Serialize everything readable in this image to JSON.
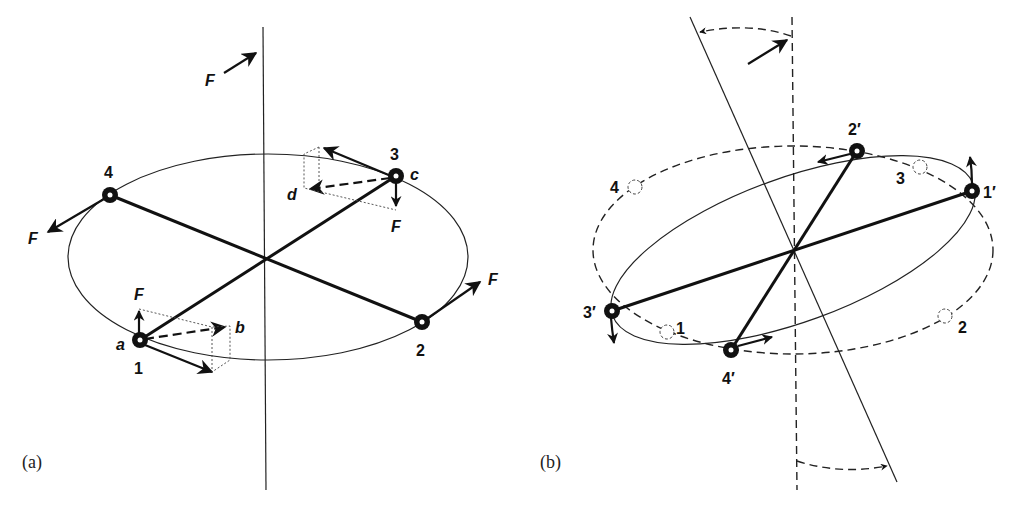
{
  "figure": {
    "panel_a": {
      "label": "(a)",
      "axis_force_label": "F",
      "masses": [
        {
          "id": "1",
          "label": "1",
          "point_label": "a",
          "force_label": "F",
          "resultant_label": "b"
        },
        {
          "id": "2",
          "label": "2",
          "force_label": "F"
        },
        {
          "id": "3",
          "label": "3",
          "point_label": "c",
          "force_label": "F",
          "resultant_label": "d"
        },
        {
          "id": "4",
          "label": "4",
          "force_label": "F"
        }
      ]
    },
    "panel_b": {
      "label": "(b)",
      "new_positions": [
        {
          "id": "1p",
          "label": "1′"
        },
        {
          "id": "2p",
          "label": "2′"
        },
        {
          "id": "3p",
          "label": "3′"
        },
        {
          "id": "4p",
          "label": "4′"
        }
      ],
      "old_positions": [
        {
          "id": "1",
          "label": "1"
        },
        {
          "id": "2",
          "label": "2"
        },
        {
          "id": "3",
          "label": "3"
        },
        {
          "id": "4",
          "label": "4"
        }
      ]
    },
    "colors": {
      "ink": "#111111",
      "background": "#ffffff"
    }
  }
}
